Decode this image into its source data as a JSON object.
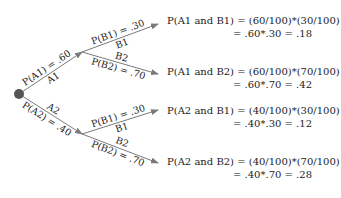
{
  "colors": {
    "line": "#7a7a7a",
    "dot": "#555555",
    "text": "#222222"
  },
  "tree": {
    "root": {
      "cx": 19,
      "cy": 94,
      "r": 5
    },
    "level1": [
      {
        "event": "A1",
        "prob_label": "P(A1) = .60",
        "to": [
          82,
          52
        ]
      },
      {
        "event": "A2",
        "prob_label": "P(A2) = .40",
        "to": [
          82,
          134
        ]
      }
    ],
    "level2": [
      {
        "parent": "A1",
        "event": "B1",
        "prob_label": "P(B1) = .30"
      },
      {
        "parent": "A1",
        "event": "B2",
        "prob_label": "P(B2) = .70"
      },
      {
        "parent": "A2",
        "event": "B1",
        "prob_label": "P(B1) = .30"
      },
      {
        "parent": "A2",
        "event": "B2",
        "prob_label": "P(B2) = .70"
      }
    ]
  },
  "formulas": [
    {
      "line1": "P(A1 and B1) = (60/100)*(30/100)",
      "line2": "= .60*.30 = .18"
    },
    {
      "line1": "P(A1 and B2) = (60/100)*(70/100)",
      "line2": "= .60*.70 = .42"
    },
    {
      "line1": "P(A2 and B1) = (40/100)*(30/100)",
      "line2": "= .40*.30 = .12"
    },
    {
      "line1": "P(A2 and B2) = (40/100)*(70/100)",
      "line2": "= .40*.70 = .28"
    }
  ]
}
